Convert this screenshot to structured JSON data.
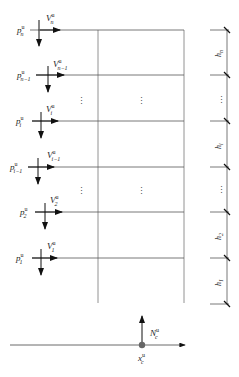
{
  "diagram": {
    "type": "multi-story frame loading diagram",
    "floors": [
      {
        "y": 30,
        "p_label": "p",
        "p_sup": "u",
        "p_sub": "n",
        "v_label": "V",
        "v_sup": "u",
        "v_sub": "n"
      },
      {
        "y": 75,
        "p_label": "p",
        "p_sup": "u",
        "p_sub": "n−1",
        "v_label": "V",
        "v_sup": "u",
        "v_sub": "n−1"
      },
      {
        "y": 121,
        "p_label": "p",
        "p_sup": "u",
        "p_sub": "i",
        "v_label": "V",
        "v_sup": "u",
        "v_sub": "i"
      },
      {
        "y": 167,
        "p_label": "p",
        "p_sup": "u",
        "p_sub": "i−1",
        "v_label": "V",
        "v_sup": "u",
        "v_sub": "i−1"
      },
      {
        "y": 212,
        "p_label": "p",
        "p_sup": "u",
        "p_sub": "2",
        "v_label": "V",
        "v_sup": "u",
        "v_sub": "2"
      },
      {
        "y": 258,
        "p_label": "p",
        "p_sup": "u",
        "p_sub": "1",
        "v_label": "V",
        "v_sup": "u",
        "v_sub": "1"
      }
    ],
    "ellipsis": "⋮",
    "heights": [
      {
        "label": "h",
        "sub": "n"
      },
      {
        "label": "⋮"
      },
      {
        "label": "h",
        "sub": "i"
      },
      {
        "label": "⋮"
      },
      {
        "label": "h",
        "sub": "2"
      },
      {
        "label": "h",
        "sub": "1"
      }
    ],
    "base_node": {
      "n_label": "N",
      "n_sup": "u",
      "n_sub": "c",
      "x_label": "x",
      "x_sup": "u",
      "x_sub": "c"
    },
    "colors": {
      "line": "#555555",
      "arrow": "#111111",
      "node": "#666666"
    }
  }
}
